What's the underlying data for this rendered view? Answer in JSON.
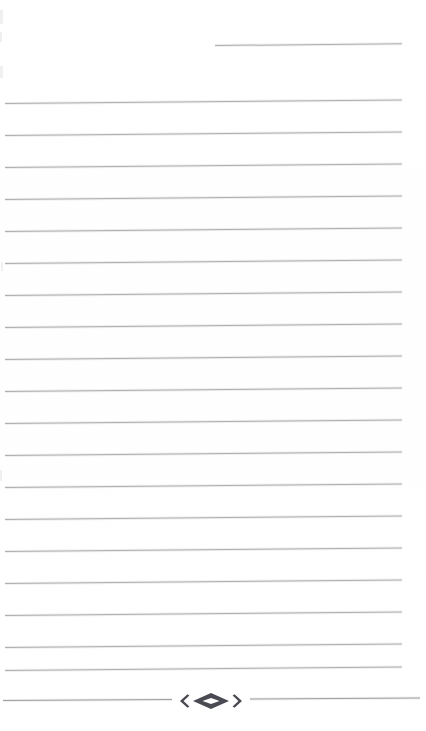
{
  "document": {
    "kind": "scanned-ruled-page",
    "title": "",
    "body_text": "",
    "background_color": "#ffffff",
    "rule_color": "#b0b0b4",
    "ornament_color": "#4a4a52",
    "page_width": 426,
    "page_height": 731
  },
  "header": {
    "short_rule": {
      "name": "top-right-rule",
      "x": 215,
      "y": 45,
      "width": 187,
      "skew_deg": -0.55
    }
  },
  "body": {
    "left_margin_x": 5,
    "right_margin_x": 402,
    "line_spacing": 31.7,
    "rule_count": 19,
    "rules": [
      {
        "y": 103,
        "x": 5,
        "width": 397,
        "skew_deg": -0.5
      },
      {
        "y": 135,
        "x": 5,
        "width": 397,
        "skew_deg": -0.5
      },
      {
        "y": 167,
        "x": 5,
        "width": 397,
        "skew_deg": -0.5
      },
      {
        "y": 199,
        "x": 5,
        "width": 397,
        "skew_deg": -0.5
      },
      {
        "y": 231,
        "x": 5,
        "width": 397,
        "skew_deg": -0.5
      },
      {
        "y": 263,
        "x": 5,
        "width": 397,
        "skew_deg": -0.5
      },
      {
        "y": 295,
        "x": 5,
        "width": 397,
        "skew_deg": -0.5
      },
      {
        "y": 327,
        "x": 5,
        "width": 397,
        "skew_deg": -0.5
      },
      {
        "y": 359,
        "x": 5,
        "width": 397,
        "skew_deg": -0.5
      },
      {
        "y": 391,
        "x": 5,
        "width": 397,
        "skew_deg": -0.5
      },
      {
        "y": 423,
        "x": 5,
        "width": 397,
        "skew_deg": -0.5
      },
      {
        "y": 455,
        "x": 5,
        "width": 397,
        "skew_deg": -0.5
      },
      {
        "y": 487,
        "x": 5,
        "width": 397,
        "skew_deg": -0.5
      },
      {
        "y": 519,
        "x": 5,
        "width": 397,
        "skew_deg": -0.5
      },
      {
        "y": 551,
        "x": 5,
        "width": 397,
        "skew_deg": -0.5
      },
      {
        "y": 583,
        "x": 5,
        "width": 397,
        "skew_deg": -0.5
      },
      {
        "y": 615,
        "x": 5,
        "width": 397,
        "skew_deg": -0.5
      },
      {
        "y": 647,
        "x": 5,
        "width": 397,
        "skew_deg": -0.5
      },
      {
        "y": 670,
        "x": 5,
        "width": 397,
        "skew_deg": -0.5
      }
    ]
  },
  "footer": {
    "ornament_rule": {
      "name": "ornament-divider",
      "y": 688,
      "x": 3,
      "width": 417,
      "skew_deg": -0.35
    },
    "ornament": {
      "name": "diamond-bracket-ornament",
      "glyph": "‹◇›",
      "center_x": 211,
      "center_y": 701,
      "width": 70,
      "color": "#4a4a52"
    }
  }
}
